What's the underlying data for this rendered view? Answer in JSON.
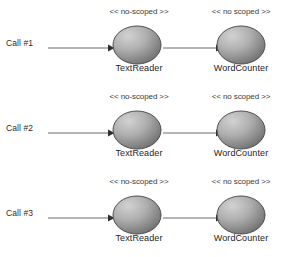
{
  "diagram": {
    "background_color": "#ffffff",
    "node_fill_light": "#c9c9c9",
    "node_fill_dark": "#6f6f6f",
    "node_stroke": "#4a4a4a",
    "arrow_color": "#555555",
    "text_color": "#2b2b2b",
    "rows": [
      {
        "call_label": "Call #1",
        "nodes": [
          {
            "stereotype": "<< no-scoped >>",
            "name": "TextReader"
          },
          {
            "stereotype": "<< no scoped >>",
            "name": "WordCounter"
          }
        ]
      },
      {
        "call_label": "Call #2",
        "nodes": [
          {
            "stereotype": "<< no-scoped >>",
            "name": "TextReader"
          },
          {
            "stereotype": "<< no scoped >>",
            "name": "WordCounter"
          }
        ]
      },
      {
        "call_label": "Call #3",
        "nodes": [
          {
            "stereotype": "<< no-scoped >>",
            "name": "TextReader"
          },
          {
            "stereotype": "<< no scoped >>",
            "name": "WordCounter"
          }
        ]
      }
    ]
  }
}
